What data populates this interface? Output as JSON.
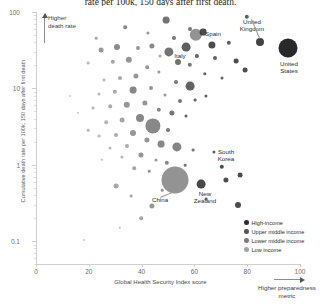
{
  "chart_data": {
    "type": "scatter",
    "title": "rate per 100k, 150 days after first death.",
    "xlabel": "Global Health Security Index score",
    "ylabel": "Cumulative death rate per 100k, 150 days after first death",
    "xlim": [
      0,
      100
    ],
    "ylim": [
      0.05,
      100
    ],
    "yscale": "log",
    "grid": false,
    "xticks": [
      "0",
      "20",
      "40",
      "60",
      "80",
      "100"
    ],
    "xtick_values": [
      0,
      20,
      40,
      60,
      80,
      100
    ],
    "yticks": [
      "100",
      "10",
      "1",
      "0.1"
    ],
    "ytick_values": [
      100,
      10,
      1,
      0.1
    ],
    "legend_position": "bottom-right",
    "series": [
      {
        "name": "High-income",
        "color": "#2e2e2e"
      },
      {
        "name": "Upper middle income",
        "color": "#555555"
      },
      {
        "name": "Lower middle income",
        "color": "#7d7d7d"
      },
      {
        "name": "Low income",
        "color": "#a5a5a5"
      }
    ],
    "annotations": [
      {
        "text": "Higher\ndeath rate",
        "direction": "up",
        "position": "top-left"
      },
      {
        "text": "Higher preparedness\nmetric",
        "direction": "right",
        "position": "bottom-right"
      }
    ],
    "labeled_points": [
      {
        "label": "United\nKingdom",
        "x": 77.9,
        "y": 62.0
      },
      {
        "label": "United\nStates",
        "x": 83.5,
        "y": 59.0
      },
      {
        "label": "Spain",
        "x": 65.9,
        "y": 63.0
      },
      {
        "label": "Italy",
        "x": 56.2,
        "y": 58.0
      },
      {
        "label": "South\nKorea",
        "x": 70.2,
        "y": 0.62
      },
      {
        "label": "New\nZealand",
        "x": 54.0,
        "y": 0.46
      },
      {
        "label": "China",
        "x": 48.2,
        "y": 0.33
      }
    ],
    "points": [
      {
        "cx": 166,
        "cy": 20,
        "r": 3.4,
        "color": "#4a4a4a",
        "o": 0.78
      },
      {
        "cx": 247,
        "cy": 17,
        "r": 2.2,
        "color": "#3a3a3a",
        "o": 0.8
      },
      {
        "cx": 190,
        "cy": 29,
        "r": 2.0,
        "color": "#4a4a4a",
        "o": 0.75
      },
      {
        "cx": 125,
        "cy": 27,
        "r": 1.8,
        "color": "#5a5a5a",
        "o": 0.7
      },
      {
        "cx": 196,
        "cy": 35,
        "r": 6.2,
        "color": "#6a6a6a",
        "o": 0.72
      },
      {
        "cx": 203,
        "cy": 32,
        "r": 3.4,
        "color": "#2e2e2e",
        "o": 0.85
      },
      {
        "cx": 148,
        "cy": 33,
        "r": 1.6,
        "color": "#6a6a6a",
        "o": 0.7
      },
      {
        "cx": 174,
        "cy": 38,
        "r": 2.0,
        "color": "#4a4a4a",
        "o": 0.75
      },
      {
        "cx": 96,
        "cy": 38,
        "r": 1.3,
        "color": "#7a7a7a",
        "o": 0.65
      },
      {
        "cx": 260,
        "cy": 42,
        "r": 4.0,
        "color": "#2e2e2e",
        "o": 0.9
      },
      {
        "cx": 288,
        "cy": 48,
        "r": 9.5,
        "color": "#1d1d1d",
        "o": 0.95
      },
      {
        "cx": 229,
        "cy": 43,
        "r": 2.2,
        "color": "#3a3a3a",
        "o": 0.82
      },
      {
        "cx": 212,
        "cy": 45,
        "r": 3.6,
        "color": "#2e2e2e",
        "o": 0.85
      },
      {
        "cx": 186,
        "cy": 47,
        "r": 4.4,
        "color": "#3a3a3a",
        "o": 0.82
      },
      {
        "cx": 152,
        "cy": 46,
        "r": 2.6,
        "color": "#5a5a5a",
        "o": 0.72
      },
      {
        "cx": 138,
        "cy": 48,
        "r": 2.0,
        "color": "#6a6a6a",
        "o": 0.7
      },
      {
        "cx": 117,
        "cy": 47,
        "r": 3.0,
        "color": "#5a5a5a",
        "o": 0.7
      },
      {
        "cx": 101,
        "cy": 50,
        "r": 2.4,
        "color": "#6a6a6a",
        "o": 0.68
      },
      {
        "cx": 169,
        "cy": 52,
        "r": 4.6,
        "color": "#4a4a4a",
        "o": 0.78
      },
      {
        "cx": 160,
        "cy": 56,
        "r": 1.5,
        "color": "#7a7a7a",
        "o": 0.65
      },
      {
        "cx": 197,
        "cy": 56,
        "r": 2.1,
        "color": "#3a3a3a",
        "o": 0.8
      },
      {
        "cx": 215,
        "cy": 58,
        "r": 2.0,
        "color": "#3a3a3a",
        "o": 0.8
      },
      {
        "cx": 236,
        "cy": 61,
        "r": 2.4,
        "color": "#2e2e2e",
        "o": 0.85
      },
      {
        "cx": 245,
        "cy": 70,
        "r": 2.4,
        "color": "#2e2e2e",
        "o": 0.85
      },
      {
        "cx": 178,
        "cy": 62,
        "r": 3.0,
        "color": "#4a4a4a",
        "o": 0.78
      },
      {
        "cx": 190,
        "cy": 65,
        "r": 2.2,
        "color": "#4a4a4a",
        "o": 0.75
      },
      {
        "cx": 129,
        "cy": 60,
        "r": 3.2,
        "color": "#6a6a6a",
        "o": 0.7
      },
      {
        "cx": 113,
        "cy": 62,
        "r": 2.2,
        "color": "#7a7a7a",
        "o": 0.66
      },
      {
        "cx": 88,
        "cy": 63,
        "r": 1.4,
        "color": "#8a8a8a",
        "o": 0.6
      },
      {
        "cx": 147,
        "cy": 67,
        "r": 1.8,
        "color": "#6a6a6a",
        "o": 0.7
      },
      {
        "cx": 159,
        "cy": 72,
        "r": 1.6,
        "color": "#6a6a6a",
        "o": 0.7
      },
      {
        "cx": 205,
        "cy": 74,
        "r": 1.7,
        "color": "#3a3a3a",
        "o": 0.8
      },
      {
        "cx": 222,
        "cy": 78,
        "r": 1.5,
        "color": "#3a3a3a",
        "o": 0.8
      },
      {
        "cx": 136,
        "cy": 76,
        "r": 2.6,
        "color": "#6a6a6a",
        "o": 0.7
      },
      {
        "cx": 120,
        "cy": 78,
        "r": 2.0,
        "color": "#7a7a7a",
        "o": 0.66
      },
      {
        "cx": 104,
        "cy": 80,
        "r": 1.5,
        "color": "#8a8a8a",
        "o": 0.62
      },
      {
        "cx": 176,
        "cy": 82,
        "r": 2.0,
        "color": "#4a4a4a",
        "o": 0.75
      },
      {
        "cx": 190,
        "cy": 86,
        "r": 4.4,
        "color": "#3a3a3a",
        "o": 0.8
      },
      {
        "cx": 151,
        "cy": 88,
        "r": 2.0,
        "color": "#6a6a6a",
        "o": 0.7
      },
      {
        "cx": 133,
        "cy": 90,
        "r": 3.4,
        "color": "#5a5a5a",
        "o": 0.72
      },
      {
        "cx": 115,
        "cy": 92,
        "r": 2.2,
        "color": "#7a7a7a",
        "o": 0.66
      },
      {
        "cx": 99,
        "cy": 94,
        "r": 1.6,
        "color": "#8a8a8a",
        "o": 0.62
      },
      {
        "cx": 165,
        "cy": 95,
        "r": 1.5,
        "color": "#6a6a6a",
        "o": 0.7
      },
      {
        "cx": 206,
        "cy": 96,
        "r": 1.6,
        "color": "#3a3a3a",
        "o": 0.8
      },
      {
        "cx": 195,
        "cy": 100,
        "r": 1.4,
        "color": "#3a3a3a",
        "o": 0.8
      },
      {
        "cx": 180,
        "cy": 101,
        "r": 2.0,
        "color": "#4a4a4a",
        "o": 0.75
      },
      {
        "cx": 145,
        "cy": 103,
        "r": 2.6,
        "color": "#6a6a6a",
        "o": 0.7
      },
      {
        "cx": 127,
        "cy": 105,
        "r": 3.2,
        "color": "#6a6a6a",
        "o": 0.7
      },
      {
        "cx": 110,
        "cy": 106,
        "r": 1.8,
        "color": "#7a7a7a",
        "o": 0.64
      },
      {
        "cx": 93,
        "cy": 108,
        "r": 1.4,
        "color": "#8a8a8a",
        "o": 0.6
      },
      {
        "cx": 159,
        "cy": 110,
        "r": 2.2,
        "color": "#5a5a5a",
        "o": 0.72
      },
      {
        "cx": 172,
        "cy": 113,
        "r": 2.6,
        "color": "#4a4a4a",
        "o": 0.76
      },
      {
        "cx": 186,
        "cy": 116,
        "r": 1.5,
        "color": "#3a3a3a",
        "o": 0.8
      },
      {
        "cx": 140,
        "cy": 118,
        "r": 4.0,
        "color": "#5a5a5a",
        "o": 0.72
      },
      {
        "cx": 122,
        "cy": 120,
        "r": 2.4,
        "color": "#7a7a7a",
        "o": 0.66
      },
      {
        "cx": 106,
        "cy": 122,
        "r": 1.8,
        "color": "#8a8a8a",
        "o": 0.62
      },
      {
        "cx": 153,
        "cy": 126,
        "r": 7.6,
        "color": "#5a5a5a",
        "o": 0.72
      },
      {
        "cx": 168,
        "cy": 130,
        "r": 2.0,
        "color": "#4a4a4a",
        "o": 0.75
      },
      {
        "cx": 133,
        "cy": 133,
        "r": 3.0,
        "color": "#6a6a6a",
        "o": 0.7
      },
      {
        "cx": 116,
        "cy": 135,
        "r": 2.0,
        "color": "#7a7a7a",
        "o": 0.64
      },
      {
        "cx": 99,
        "cy": 136,
        "r": 1.4,
        "color": "#8a8a8a",
        "o": 0.6
      },
      {
        "cx": 147,
        "cy": 140,
        "r": 2.6,
        "color": "#6a6a6a",
        "o": 0.7
      },
      {
        "cx": 161,
        "cy": 144,
        "r": 3.4,
        "color": "#5a5a5a",
        "o": 0.72
      },
      {
        "cx": 127,
        "cy": 146,
        "r": 2.0,
        "color": "#7a7a7a",
        "o": 0.64
      },
      {
        "cx": 110,
        "cy": 148,
        "r": 1.5,
        "color": "#8a8a8a",
        "o": 0.6
      },
      {
        "cx": 177,
        "cy": 147,
        "r": 4.6,
        "color": "#5a5a5a",
        "o": 0.74
      },
      {
        "cx": 193,
        "cy": 150,
        "r": 1.4,
        "color": "#4a4a4a",
        "o": 0.75
      },
      {
        "cx": 214,
        "cy": 152,
        "r": 1.6,
        "color": "#3a3a3a",
        "o": 0.8
      },
      {
        "cx": 141,
        "cy": 155,
        "r": 2.6,
        "color": "#6a6a6a",
        "o": 0.7
      },
      {
        "cx": 122,
        "cy": 157,
        "r": 1.6,
        "color": "#8a8a8a",
        "o": 0.62
      },
      {
        "cx": 156,
        "cy": 160,
        "r": 1.5,
        "color": "#6a6a6a",
        "o": 0.7
      },
      {
        "cx": 167,
        "cy": 163,
        "r": 2.2,
        "color": "#5a5a5a",
        "o": 0.72
      },
      {
        "cx": 185,
        "cy": 165,
        "r": 1.3,
        "color": "#4a4a4a",
        "o": 0.75
      },
      {
        "cx": 222,
        "cy": 167,
        "r": 2.2,
        "color": "#2e2e2e",
        "o": 0.85
      },
      {
        "cx": 134,
        "cy": 168,
        "r": 1.8,
        "color": "#7a7a7a",
        "o": 0.66
      },
      {
        "cx": 149,
        "cy": 171,
        "r": 1.3,
        "color": "#6a6a6a",
        "o": 0.7
      },
      {
        "cx": 240,
        "cy": 175,
        "r": 2.4,
        "color": "#2e2e2e",
        "o": 0.85
      },
      {
        "cx": 226,
        "cy": 180,
        "r": 2.6,
        "color": "#2e2e2e",
        "o": 0.85
      },
      {
        "cx": 175,
        "cy": 180,
        "r": 13.5,
        "color": "#6a6a6a",
        "o": 0.72
      },
      {
        "cx": 201,
        "cy": 184,
        "r": 4.4,
        "color": "#2e2e2e",
        "o": 0.88
      },
      {
        "cx": 162,
        "cy": 190,
        "r": 1.3,
        "color": "#6a6a6a",
        "o": 0.7
      },
      {
        "cx": 116,
        "cy": 186,
        "r": 2.4,
        "color": "#7a7a7a",
        "o": 0.66
      },
      {
        "cx": 131,
        "cy": 196,
        "r": 1.4,
        "color": "#7a7a7a",
        "o": 0.64
      },
      {
        "cx": 102,
        "cy": 160,
        "r": 1.2,
        "color": "#8a8a8a",
        "o": 0.6
      },
      {
        "cx": 206,
        "cy": 199,
        "r": 1.4,
        "color": "#3a3a3a",
        "o": 0.8
      },
      {
        "cx": 238,
        "cy": 205,
        "r": 3.0,
        "color": "#2e2e2e",
        "o": 0.85
      },
      {
        "cx": 152,
        "cy": 206,
        "r": 2.6,
        "color": "#6a6a6a",
        "o": 0.7
      },
      {
        "cx": 141,
        "cy": 218,
        "r": 1.8,
        "color": "#7a7a7a",
        "o": 0.66
      },
      {
        "cx": 120,
        "cy": 228,
        "r": 1.2,
        "color": "#8a8a8a",
        "o": 0.6
      },
      {
        "cx": 84,
        "cy": 240,
        "r": 1.1,
        "color": "#9a9a9a",
        "o": 0.55
      },
      {
        "cx": 78,
        "cy": 113,
        "r": 1.2,
        "color": "#9a9a9a",
        "o": 0.58
      },
      {
        "cx": 70,
        "cy": 96,
        "r": 1.1,
        "color": "#9a9a9a",
        "o": 0.55
      },
      {
        "cx": 88,
        "cy": 130,
        "r": 1.3,
        "color": "#8a8a8a",
        "o": 0.6
      }
    ]
  }
}
